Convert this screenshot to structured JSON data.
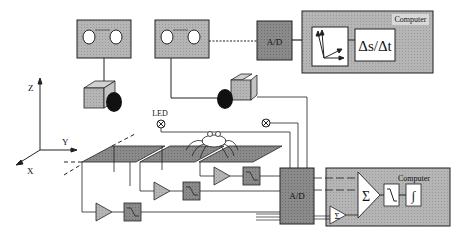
{
  "diagram": {
    "axes": {
      "z_label": "Z",
      "y_label": "Y",
      "x_label": "X"
    },
    "led_label": "LED",
    "top_row": {
      "ad_label": "A/D",
      "computer_label": "Computer",
      "velocity_label": "Δs/Δt"
    },
    "bottom_row": {
      "ad_label": "A/D",
      "computer_label": "Computer",
      "sum_label": "Σ",
      "small_sum_label": "Σ",
      "integrator_label": "∫"
    },
    "colors": {
      "box_fill": "#b8b8b8",
      "dark_fill": "#8f8f8f",
      "plate_fill": "#7e7e7e",
      "line": "#222222"
    }
  }
}
